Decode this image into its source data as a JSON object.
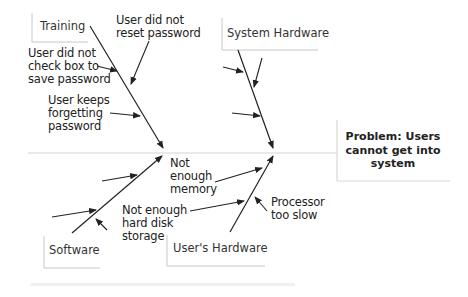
{
  "diagram": {
    "type": "fishbone",
    "problem": {
      "label": "Problem: Users\ncannot get into\nsystem"
    },
    "categories": [
      {
        "name": "Training",
        "position": "top-left",
        "causes": [
          "User did not\nreset password",
          "User did not\ncheck box to\nsave password",
          "User keeps\nforgetting\npassword"
        ]
      },
      {
        "name": "System Hardware",
        "position": "top-right",
        "causes": [
          "",
          "",
          ""
        ]
      },
      {
        "name": "Software",
        "position": "bottom-left",
        "causes": [
          "",
          "",
          ""
        ]
      },
      {
        "name": "User's Hardware",
        "position": "bottom-right",
        "causes": [
          "Not\nenough\nmemory",
          "Not enough\nhard disk\nstorage",
          "Processor\ntoo slow"
        ]
      }
    ],
    "colors": {
      "line": "#222222",
      "box_border": "#c8c8c8",
      "spine": "#d4d4d4"
    }
  }
}
